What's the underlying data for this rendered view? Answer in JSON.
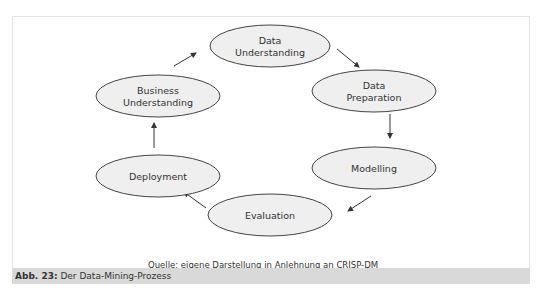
{
  "figure": {
    "nodes": [
      {
        "id": "data-understanding",
        "lines": [
          "Data",
          "Understanding"
        ]
      },
      {
        "id": "data-preparation",
        "lines": [
          "Data",
          "Preparation"
        ]
      },
      {
        "id": "modelling",
        "lines": [
          "Modelling"
        ]
      },
      {
        "id": "evaluation",
        "lines": [
          "Evaluation"
        ]
      },
      {
        "id": "deployment",
        "lines": [
          "Deployment"
        ]
      },
      {
        "id": "business-understanding",
        "lines": [
          "Business",
          "Understanding"
        ]
      }
    ],
    "edges": [
      {
        "from": "business-understanding",
        "to": "data-understanding"
      },
      {
        "from": "data-understanding",
        "to": "data-preparation"
      },
      {
        "from": "data-preparation",
        "to": "modelling"
      },
      {
        "from": "modelling",
        "to": "evaluation"
      },
      {
        "from": "evaluation",
        "to": "deployment"
      },
      {
        "from": "deployment",
        "to": "business-understanding"
      }
    ],
    "node_fill": "#efefef",
    "node_stroke": "#444444",
    "source_note": "Quelle: eigene Darstellung in Anlehnung an CRISP-DM"
  },
  "caption": {
    "label": "Abb. 23:",
    "text": " Der Data-Mining-Prozess",
    "background": "#d9d9d9"
  }
}
